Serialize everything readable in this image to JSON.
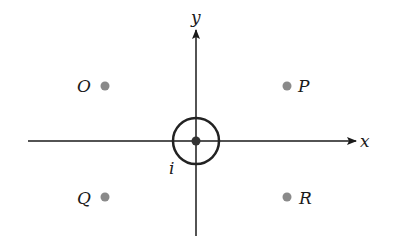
{
  "diagram": {
    "axes": {
      "x_label": "x",
      "y_label": "y",
      "origin": [
        196,
        141
      ],
      "x_range_px": [
        28,
        355
      ],
      "y_range_px": [
        28,
        236
      ],
      "color": "#1a1a1a"
    },
    "current": {
      "label": "i",
      "description": "current-carrying wire at origin with circular field line",
      "circle_radius_px": 23,
      "center_dot_color": "#333333"
    },
    "points": [
      {
        "label": "O",
        "x": 105,
        "y": 86,
        "label_side": "left"
      },
      {
        "label": "P",
        "x": 287,
        "y": 86,
        "label_side": "right"
      },
      {
        "label": "Q",
        "x": 105,
        "y": 197,
        "label_side": "left"
      },
      {
        "label": "R",
        "x": 287,
        "y": 197,
        "label_side": "right"
      }
    ],
    "point_color": "#8a8a8a"
  }
}
